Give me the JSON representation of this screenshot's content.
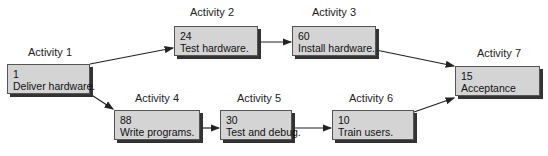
{
  "diagram": {
    "type": "activity-network",
    "activities": [
      {
        "id": 1,
        "label": "Activity 1",
        "duration": "1",
        "name": "Deliver hardware."
      },
      {
        "id": 2,
        "label": "Activity 2",
        "duration": "24",
        "name": "Test hardware."
      },
      {
        "id": 3,
        "label": "Activity 3",
        "duration": "60",
        "name": "Install hardware."
      },
      {
        "id": 4,
        "label": "Activity 4",
        "duration": "88",
        "name": "Write programs."
      },
      {
        "id": 5,
        "label": "Activity 5",
        "duration": "30",
        "name": "Test and debug."
      },
      {
        "id": 6,
        "label": "Activity 6",
        "duration": "10",
        "name": "Train users."
      },
      {
        "id": 7,
        "label": "Activity 7",
        "duration": "15",
        "name": "Acceptance"
      }
    ],
    "edges": [
      {
        "from": 1,
        "to": 2
      },
      {
        "from": 2,
        "to": 3
      },
      {
        "from": 3,
        "to": 7
      },
      {
        "from": 1,
        "to": 4
      },
      {
        "from": 4,
        "to": 5
      },
      {
        "from": 5,
        "to": 6
      },
      {
        "from": 6,
        "to": 7
      }
    ],
    "colors": {
      "box_fill": "#d4d4d4",
      "box_border": "#555555",
      "shadow": "#333333",
      "arrow": "#222222"
    }
  }
}
